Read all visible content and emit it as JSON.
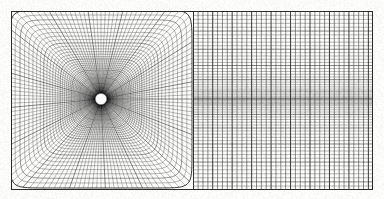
{
  "figure": {
    "kind": "computational-mesh-plot",
    "title": "",
    "background_color": "#fcfcfb",
    "line_color": "#1a1a1a",
    "canvas": {
      "width": 384,
      "height": 199
    },
    "plot_frame": {
      "x0": 11,
      "y0": 11,
      "x1": 373,
      "y1": 190,
      "border_visible": true,
      "border_color": "#2a2a2a"
    },
    "blocks": [
      {
        "name": "o-grid-block",
        "description": "Radial O-type mesh wrapped around a circular cylinder, transitioning from polar near the body to rectangular at the block boundary",
        "x0": 11,
        "y0": 11,
        "x1": 193,
        "y1": 190,
        "center_x": 101,
        "center_y": 99,
        "cylinder_radius": 5.0,
        "cylinder_fill": "#ffffff",
        "radial_lines": 132,
        "circumferential_rings": 62,
        "first_ring_radius": 5.0,
        "outer_ring_half_width": 91,
        "outer_ring_half_height": 89,
        "stretching": "geometric",
        "stretch_ratio": 1.062,
        "ring_superellipse_exponent_inner": 2.0,
        "ring_superellipse_exponent_outer": 14.0
      },
      {
        "name": "cartesian-wake-block",
        "description": "Structured rectangular Cartesian mesh downstream of the cylinder block; vertical grid lines uniformly spaced, horizontal lines clustered toward the wake centreline",
        "x0": 193,
        "y0": 11,
        "x1": 373,
        "y1": 190,
        "vertical_lines": 37,
        "vertical_spacing": 5.0,
        "horizontal_lines": 62,
        "horizontal_clustering_center": 99,
        "horizontal_min_spacing": 1.9,
        "horizontal_max_spacing": 4.4
      }
    ],
    "line_weights": {
      "thin": 0.38,
      "medium": 0.55,
      "heavy": 0.85,
      "frame": 1.0
    }
  }
}
